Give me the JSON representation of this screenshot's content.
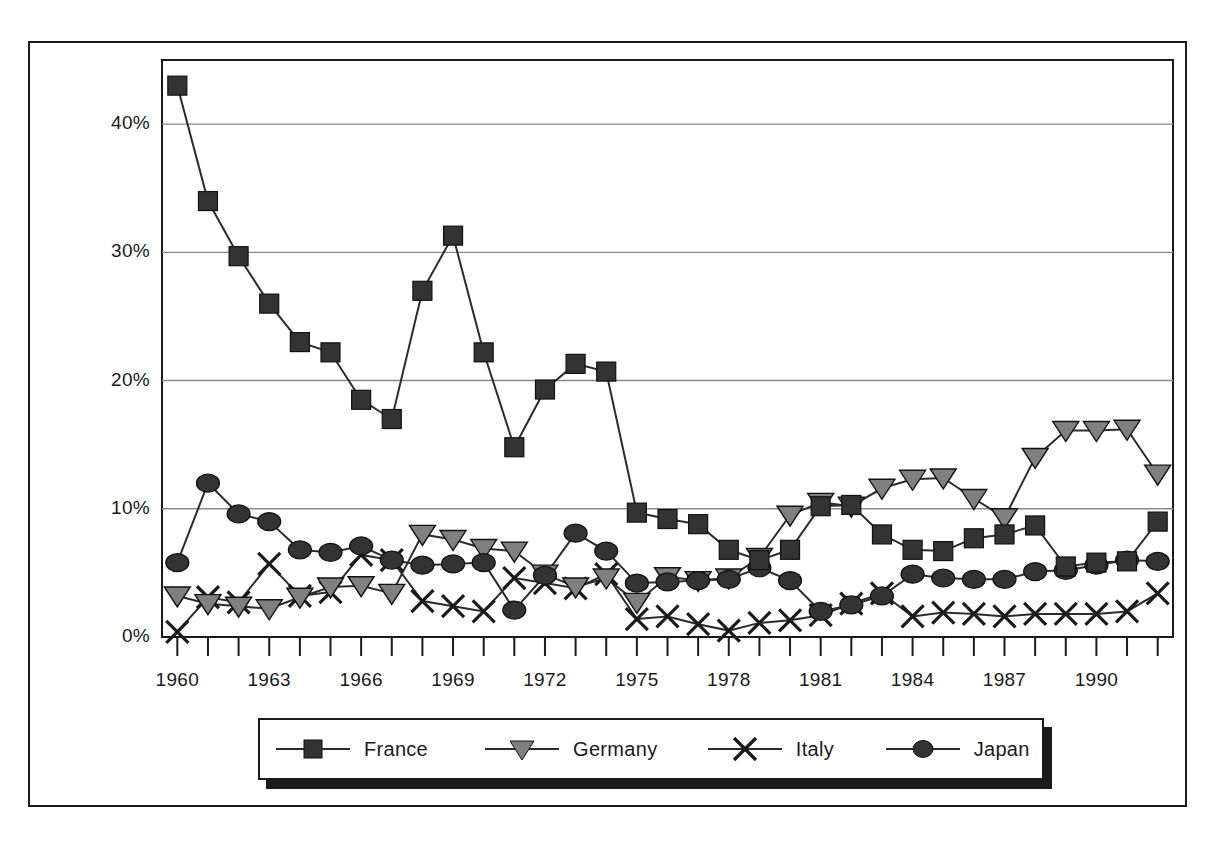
{
  "chart_data": {
    "type": "line",
    "title": "",
    "xlabel": "",
    "ylabel": "",
    "ylim": [
      0,
      45
    ],
    "yticks": [
      0,
      10,
      20,
      30,
      40
    ],
    "ytick_labels": [
      "0%",
      "10%",
      "20%",
      "30%",
      "40%"
    ],
    "grid": "horizontal",
    "legend_position": "bottom",
    "x": [
      1960,
      1961,
      1962,
      1963,
      1964,
      1965,
      1966,
      1967,
      1968,
      1969,
      1970,
      1971,
      1972,
      1973,
      1974,
      1975,
      1976,
      1977,
      1978,
      1979,
      1980,
      1981,
      1982,
      1983,
      1984,
      1985,
      1986,
      1987,
      1988,
      1989,
      1990,
      1991,
      1992
    ],
    "xtick_labels": [
      "1960",
      "",
      "",
      "1963",
      "",
      "",
      "1966",
      "",
      "",
      "1969",
      "",
      "",
      "1972",
      "",
      "",
      "1975",
      "",
      "",
      "1978",
      "",
      "",
      "1981",
      "",
      "",
      "1984",
      "",
      "",
      "1987",
      "",
      "",
      "1990",
      "",
      ""
    ],
    "series": [
      {
        "name": "France",
        "marker": "square",
        "color": "#333333",
        "values": [
          43.0,
          34.0,
          29.7,
          26.0,
          23.0,
          22.2,
          18.5,
          17.0,
          27.0,
          31.3,
          22.2,
          14.8,
          19.3,
          21.3,
          20.7,
          9.7,
          9.2,
          8.8,
          6.8,
          6.0,
          6.8,
          10.2,
          10.3,
          8.0,
          6.8,
          6.7,
          7.7,
          8.0,
          8.7,
          5.5,
          5.8,
          5.9,
          9.0
        ]
      },
      {
        "name": "Germany",
        "marker": "triangle-down",
        "color": "#808080",
        "values": [
          3.2,
          2.6,
          2.4,
          2.2,
          3.1,
          3.9,
          4.0,
          3.4,
          8.0,
          7.6,
          6.9,
          6.7,
          4.9,
          3.9,
          4.6,
          2.7,
          4.7,
          4.4,
          4.6,
          6.2,
          9.5,
          10.5,
          10.2,
          11.6,
          12.3,
          12.4,
          10.8,
          9.3,
          14.0,
          16.1,
          16.1,
          16.2,
          12.7
        ]
      },
      {
        "name": "Italy",
        "marker": "x",
        "color": "#1a1a1a",
        "values": [
          0.4,
          3.1,
          2.7,
          5.7,
          3.2,
          3.5,
          6.4,
          6.0,
          2.8,
          2.4,
          2.0,
          4.6,
          4.2,
          3.8,
          4.9,
          1.4,
          1.6,
          1.0,
          0.5,
          1.1,
          1.3,
          1.7,
          2.6,
          3.4,
          1.6,
          1.9,
          1.8,
          1.6,
          1.8,
          1.8,
          1.8,
          2.0,
          3.4
        ]
      },
      {
        "name": "Japan",
        "marker": "circle",
        "color": "#333333",
        "values": [
          5.8,
          12.0,
          9.6,
          9.0,
          6.8,
          6.6,
          7.1,
          6.0,
          5.6,
          5.7,
          5.8,
          2.1,
          4.8,
          8.1,
          6.7,
          4.2,
          4.3,
          4.4,
          4.5,
          5.4,
          4.4,
          2.0,
          2.5,
          3.2,
          4.9,
          4.6,
          4.5,
          4.5,
          5.1,
          5.2,
          5.6,
          6.0,
          5.9
        ]
      }
    ]
  },
  "legend": {
    "items": [
      {
        "label": "France",
        "marker": "square-marker"
      },
      {
        "label": "Germany",
        "marker": "triangle-down-marker"
      },
      {
        "label": "Italy",
        "marker": "x-marker"
      },
      {
        "label": "Japan",
        "marker": "circle-marker"
      }
    ]
  }
}
